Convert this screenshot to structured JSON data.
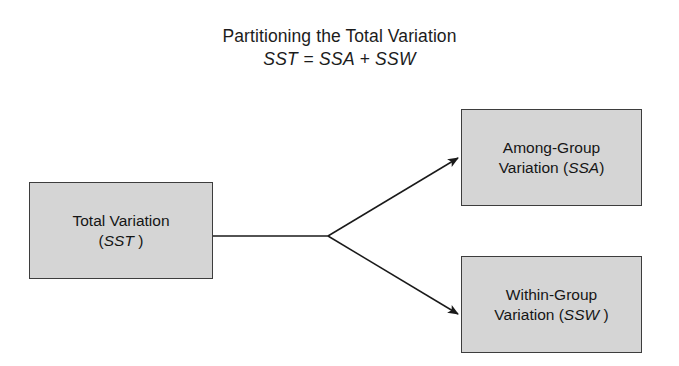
{
  "diagram": {
    "title": {
      "line1": "Partitioning the Total Variation",
      "line2": "SST = SSA + SSW"
    },
    "background_color": "#ffffff",
    "node_fill_color": "#d5d5d5",
    "node_border_color": "#3d3d3d",
    "connector_color": "#1a1a1a",
    "nodes": [
      {
        "id": "total-variation",
        "line1": "Total Variation",
        "line2_prefix": "(",
        "line2_symbol": "SST",
        "line2_suffix": " )"
      },
      {
        "id": "among-group-variation",
        "line1": "Among-Group",
        "line2_prefix": "Variation (",
        "line2_symbol": "SSA",
        "line2_suffix": ")"
      },
      {
        "id": "within-group-variation",
        "line1": "Within-Group",
        "line2_prefix": "Variation (",
        "line2_symbol": "SSW",
        "line2_suffix": " )"
      }
    ],
    "connectors": [
      {
        "id": "trunk",
        "from": "total-variation",
        "to": "branch-point",
        "arrow": false
      },
      {
        "id": "branch-upper",
        "from": "branch-point",
        "to": "among-group-variation",
        "arrow": true
      },
      {
        "id": "branch-lower",
        "from": "branch-point",
        "to": "within-group-variation",
        "arrow": true
      }
    ]
  }
}
